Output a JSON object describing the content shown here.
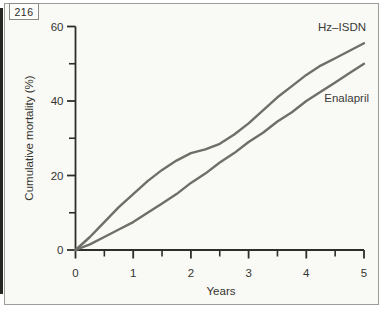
{
  "page_number": "216",
  "figure": {
    "background": "#f9f9f6",
    "frame_color": "#9c9c99"
  },
  "chart_data": {
    "type": "line",
    "title": "",
    "xlabel": "Years",
    "ylabel": "Cumulative mortality (%)",
    "xlim": [
      0,
      5
    ],
    "ylim": [
      0,
      60
    ],
    "x_major_ticks": [
      0,
      1,
      2,
      3,
      4,
      5
    ],
    "x_minor_ticks": [
      0.5,
      1.5,
      2.5,
      3.5,
      4.5
    ],
    "y_major_ticks": [
      0,
      20,
      40,
      60
    ],
    "y_minor_ticks": [
      10,
      30,
      50
    ],
    "grid": false,
    "legend_position": "inline-end-labels",
    "colors": {
      "line": "#6f6f68",
      "axis": "#2d2d2a",
      "text": "#35352f"
    },
    "series": [
      {
        "name": "Hz–ISDN",
        "x": [
          0,
          0.25,
          0.5,
          0.75,
          1,
          1.25,
          1.5,
          1.75,
          2,
          2.25,
          2.5,
          2.75,
          3,
          3.25,
          3.5,
          3.75,
          4,
          4.25,
          4.5,
          4.75,
          5
        ],
        "y": [
          0,
          3.5,
          7.5,
          11.5,
          15,
          18.5,
          21.5,
          24,
          26,
          27,
          28.5,
          31,
          34,
          37.5,
          41,
          44,
          47,
          49.5,
          51.5,
          53.5,
          55.5
        ]
      },
      {
        "name": "Enalapril",
        "x": [
          0,
          0.25,
          0.5,
          0.75,
          1,
          1.25,
          1.5,
          1.75,
          2,
          2.25,
          2.5,
          2.75,
          3,
          3.25,
          3.5,
          3.75,
          4,
          4.25,
          4.5,
          4.75,
          5
        ],
        "y": [
          0,
          1.5,
          3.5,
          5.5,
          7.5,
          10,
          12.5,
          15,
          18,
          20.5,
          23.5,
          26,
          29,
          31.5,
          34.5,
          37,
          40,
          42.5,
          45,
          47.5,
          50
        ]
      }
    ]
  }
}
